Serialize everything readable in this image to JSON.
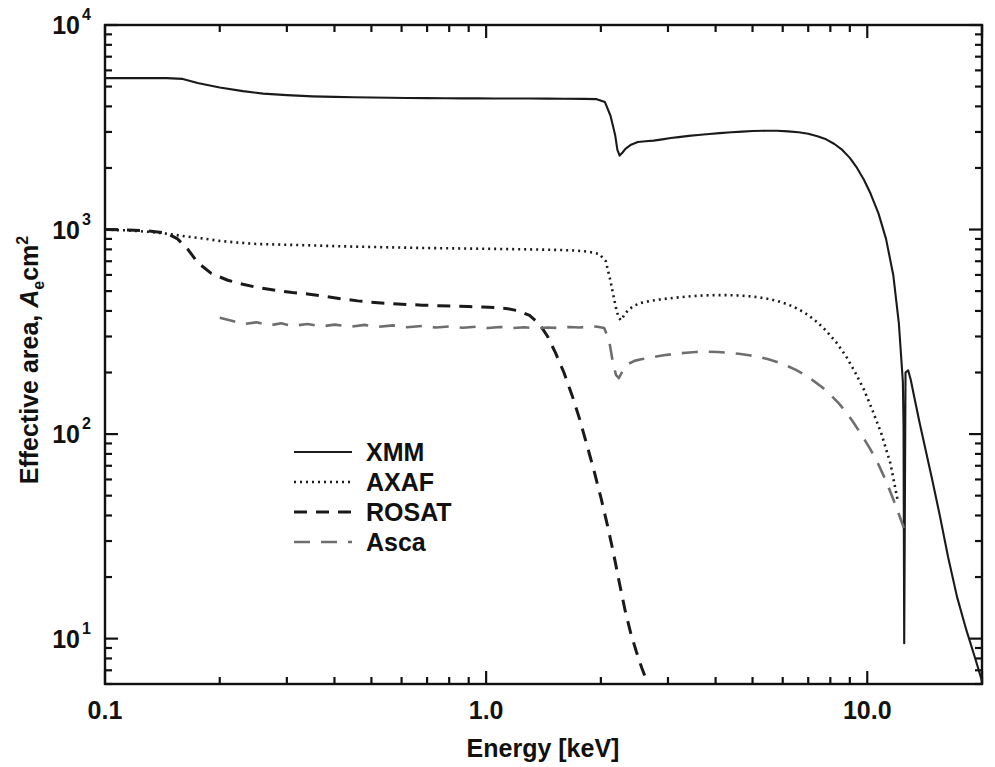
{
  "chart_data": {
    "type": "line",
    "title": "",
    "xlabel": "Energy [keV]",
    "ylabel": "Effective area, A_e cm^2",
    "ylabel_parts": {
      "pre": "Effective area, ",
      "italic": "A",
      "sub": "e",
      "post": "cm",
      "sup": "2"
    },
    "xscale": "log",
    "yscale": "log",
    "xlim": [
      0.1,
      20.0
    ],
    "ylim": [
      6.0,
      10000.0
    ],
    "grid": false,
    "legend_position": "center-left",
    "xticks_major": [
      0.1,
      1.0,
      10.0
    ],
    "xtick_labels": [
      "0.1",
      "1.0",
      "10.0"
    ],
    "yticks_major": [
      10,
      100,
      1000,
      10000
    ],
    "ytick_labels": [
      "10",
      "10",
      "10",
      "10"
    ],
    "ytick_exponents": [
      "1",
      "2",
      "3",
      "4"
    ],
    "series": [
      {
        "name": "XMM",
        "style": "solid",
        "color": "#1a1a1a",
        "x": [
          0.1,
          0.12,
          0.145,
          0.16,
          0.175,
          0.2,
          0.23,
          0.26,
          0.3,
          0.35,
          0.4,
          0.45,
          0.5,
          0.56,
          0.62,
          0.7,
          0.78,
          0.86,
          0.95,
          1.05,
          1.15,
          1.3,
          1.45,
          1.6,
          1.8,
          1.95,
          2.05,
          2.12,
          2.18,
          2.21,
          2.24,
          2.28,
          2.32,
          2.4,
          2.5,
          2.62,
          2.75,
          2.9,
          3.05,
          3.2,
          3.4,
          3.6,
          3.85,
          4.1,
          4.4,
          4.7,
          5.0,
          5.4,
          5.8,
          6.2,
          6.6,
          7.0,
          7.4,
          7.8,
          8.2,
          8.6,
          9.0,
          9.4,
          9.8,
          10.2,
          10.7,
          11.2,
          11.7,
          12.1,
          12.4,
          12.45,
          12.5,
          12.6,
          12.8,
          13.0,
          13.3,
          13.7,
          14.2,
          14.8,
          15.5,
          16.3,
          17.2,
          18.2,
          19.2,
          20.0
        ],
        "y": [
          5500,
          5500,
          5500,
          5450,
          5200,
          4950,
          4750,
          4620,
          4540,
          4480,
          4450,
          4430,
          4420,
          4410,
          4400,
          4390,
          4385,
          4380,
          4380,
          4375,
          4370,
          4370,
          4365,
          4360,
          4355,
          4340,
          4200,
          3600,
          2900,
          2450,
          2300,
          2380,
          2480,
          2600,
          2680,
          2700,
          2720,
          2760,
          2800,
          2830,
          2870,
          2900,
          2930,
          2960,
          2990,
          3010,
          3030,
          3040,
          3040,
          3020,
          2990,
          2940,
          2860,
          2760,
          2620,
          2450,
          2240,
          2000,
          1750,
          1500,
          1200,
          900,
          600,
          350,
          180,
          110,
          9.5,
          200,
          205,
          185,
          150,
          115,
          85,
          60,
          40,
          25,
          16,
          11,
          8,
          6.2
        ]
      },
      {
        "name": "AXAF",
        "style": "dotted",
        "color": "#1a1a1a",
        "x": [
          0.1,
          0.115,
          0.13,
          0.145,
          0.16,
          0.18,
          0.2,
          0.22,
          0.25,
          0.28,
          0.32,
          0.36,
          0.4,
          0.45,
          0.5,
          0.56,
          0.63,
          0.7,
          0.78,
          0.87,
          0.96,
          1.06,
          1.16,
          1.28,
          1.4,
          1.55,
          1.7,
          1.85,
          1.98,
          2.06,
          2.12,
          2.16,
          2.2,
          2.23,
          2.26,
          2.3,
          2.36,
          2.45,
          2.55,
          2.7,
          2.85,
          3.0,
          3.2,
          3.45,
          3.7,
          4.0,
          4.3,
          4.6,
          4.9,
          5.2,
          5.5,
          5.8,
          6.2,
          6.6,
          7.0,
          7.4,
          7.8,
          8.3,
          8.8,
          9.3,
          9.8,
          10.3,
          10.9,
          11.5,
          12.0
        ],
        "y": [
          1000,
          990,
          975,
          955,
          930,
          905,
          880,
          865,
          850,
          845,
          840,
          835,
          830,
          825,
          822,
          818,
          815,
          812,
          810,
          808,
          806,
          804,
          802,
          800,
          798,
          795,
          790,
          780,
          760,
          700,
          560,
          470,
          400,
          370,
          360,
          380,
          405,
          425,
          438,
          448,
          455,
          460,
          466,
          472,
          476,
          478,
          478,
          476,
          472,
          466,
          458,
          448,
          430,
          408,
          382,
          352,
          320,
          280,
          240,
          200,
          165,
          132,
          100,
          72,
          48
        ]
      },
      {
        "name": "ROSAT",
        "style": "dashed",
        "color": "#1a1a1a",
        "x": [
          0.1,
          0.115,
          0.13,
          0.145,
          0.155,
          0.165,
          0.175,
          0.19,
          0.21,
          0.23,
          0.25,
          0.28,
          0.31,
          0.34,
          0.38,
          0.42,
          0.46,
          0.51,
          0.56,
          0.62,
          0.68,
          0.75,
          0.82,
          0.9,
          0.98,
          1.06,
          1.14,
          1.22,
          1.3,
          1.38,
          1.45,
          1.52,
          1.6,
          1.68,
          1.76,
          1.84,
          1.92,
          2.0,
          2.08,
          2.16,
          2.24,
          2.32,
          2.4,
          2.48,
          2.56,
          2.64
        ],
        "y": [
          1000,
          995,
          985,
          960,
          900,
          800,
          690,
          610,
          565,
          540,
          522,
          505,
          492,
          484,
          470,
          458,
          448,
          440,
          434,
          430,
          427,
          424,
          422,
          420,
          418,
          415,
          410,
          400,
          380,
          345,
          300,
          250,
          200,
          155,
          118,
          88,
          66,
          49,
          36,
          26,
          18.5,
          13.5,
          10.5,
          8.6,
          7.2,
          6.2
        ]
      },
      {
        "name": "Asca",
        "style": "longdash",
        "color": "#6e6e6e",
        "x": [
          0.2,
          0.215,
          0.23,
          0.25,
          0.27,
          0.29,
          0.31,
          0.34,
          0.37,
          0.4,
          0.44,
          0.48,
          0.52,
          0.57,
          0.62,
          0.68,
          0.74,
          0.8,
          0.87,
          0.94,
          1.01,
          1.09,
          1.17,
          1.26,
          1.35,
          1.45,
          1.55,
          1.65,
          1.76,
          1.87,
          1.96,
          2.04,
          2.1,
          2.15,
          2.19,
          2.23,
          2.27,
          2.32,
          2.38,
          2.45,
          2.55,
          2.68,
          2.82,
          2.98,
          3.15,
          3.35,
          3.55,
          3.8,
          4.05,
          4.3,
          4.6,
          4.9,
          5.2,
          5.5,
          5.8,
          6.15,
          6.5,
          6.85,
          7.2,
          7.6,
          8.0,
          8.4,
          8.8,
          9.2,
          9.7,
          10.2,
          10.7,
          11.2,
          11.7,
          12.2,
          12.6
        ],
        "y": [
          370,
          358,
          345,
          352,
          340,
          348,
          338,
          345,
          336,
          343,
          335,
          342,
          334,
          340,
          333,
          338,
          332,
          336,
          331,
          335,
          330,
          334,
          330,
          333,
          329,
          332,
          330,
          334,
          332,
          336,
          335,
          330,
          290,
          225,
          195,
          188,
          200,
          215,
          222,
          228,
          232,
          236,
          240,
          244,
          247,
          250,
          252,
          253,
          252,
          250,
          247,
          243,
          238,
          232,
          225,
          216,
          206,
          195,
          183,
          170,
          156,
          142,
          128,
          114,
          98,
          84,
          71,
          59,
          48,
          39,
          33
        ]
      }
    ]
  },
  "legend": {
    "items": [
      {
        "label": "XMM",
        "style": "solid",
        "color": "#1a1a1a"
      },
      {
        "label": "AXAF",
        "style": "dotted",
        "color": "#1a1a1a"
      },
      {
        "label": "ROSAT",
        "style": "dashed",
        "color": "#1a1a1a"
      },
      {
        "label": "Asca",
        "style": "longdash",
        "color": "#6e6e6e"
      }
    ]
  },
  "axes": {
    "x_title": "Energy [keV]",
    "y_title_pre": "Effective area, ",
    "y_title_italic": "A",
    "y_title_sub": "e",
    "y_title_post": "cm",
    "y_title_sup": "2",
    "x_tick_labels": [
      "0.1",
      "1.0",
      "10.0"
    ],
    "y_tick_mantissa": "10",
    "y_tick_exponents": [
      "4",
      "3",
      "2",
      "1"
    ]
  }
}
